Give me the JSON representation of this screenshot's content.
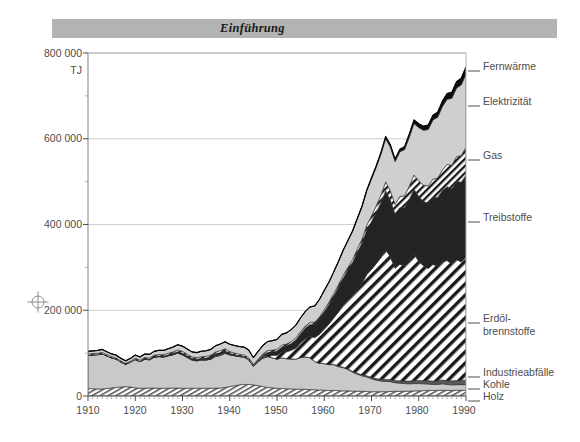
{
  "banner": {
    "title": "Einführung"
  },
  "chart_data": {
    "type": "area",
    "stacked": true,
    "title": "",
    "subtitle": "",
    "xlabel": "",
    "ylabel": "TJ",
    "unit": "TJ",
    "xlim": [
      1910,
      1990
    ],
    "ylim": [
      0,
      800000
    ],
    "xticks": [
      1910,
      1920,
      1930,
      1940,
      1950,
      1960,
      1970,
      1980,
      1990
    ],
    "xticklabels": [
      "1910",
      "1920",
      "1930",
      "1940",
      "1950",
      "1960",
      "1970",
      "1980",
      "1990"
    ],
    "minor_xtick_step": 1,
    "yticks": [
      0,
      200000,
      400000,
      600000,
      800000
    ],
    "yticklabels": [
      "0",
      "200 000",
      "400 000",
      "600 000",
      "800 000"
    ],
    "minor_yticks": [
      100000,
      300000,
      500000,
      700000
    ],
    "grid": "horizontal-major",
    "legend_position": "right-inline",
    "legend": [
      {
        "name": "Fernwärme",
        "fill": "#111111",
        "pattern": "solid-black",
        "y_label": 66
      },
      {
        "name": "Elektrizität",
        "fill": "#cccccc",
        "pattern": "solid-grey",
        "y_label": 101
      },
      {
        "name": "Gas",
        "fill": "#ffffff",
        "pattern": "hatch-fine",
        "y_label": 155
      },
      {
        "name": "Treibstoffe",
        "fill": "#262626",
        "pattern": "solid-dark",
        "y_label": 217
      },
      {
        "name": "Erdöl-\nbrennstoffe",
        "fill": "#ffffff",
        "pattern": "hatch-wide",
        "y_label": 318
      },
      {
        "name": "Industrieabfälle",
        "fill": "#555555",
        "pattern": "solid-grey-dk",
        "y_label": 372
      },
      {
        "name": "Kohle",
        "fill": "#cccccc",
        "pattern": "solid-grey",
        "y_label": 384
      },
      {
        "name": "Holz",
        "fill": "#ffffff",
        "pattern": "hatch-fine",
        "y_label": 396
      }
    ],
    "legend_labels_flat": [
      "Fernwärme",
      "Elektrizität",
      "Gas",
      "Treibstoffe",
      "Erdöl-",
      "brennstoffe",
      "Industrieabfälle",
      "Kohle",
      "Holz"
    ],
    "x": [
      1910,
      1911,
      1912,
      1913,
      1914,
      1915,
      1916,
      1917,
      1918,
      1919,
      1920,
      1921,
      1922,
      1923,
      1924,
      1925,
      1926,
      1927,
      1928,
      1929,
      1930,
      1931,
      1932,
      1933,
      1934,
      1935,
      1936,
      1937,
      1938,
      1939,
      1940,
      1941,
      1942,
      1943,
      1944,
      1945,
      1946,
      1947,
      1948,
      1949,
      1950,
      1951,
      1952,
      1953,
      1954,
      1955,
      1956,
      1957,
      1958,
      1959,
      1960,
      1961,
      1962,
      1963,
      1964,
      1965,
      1966,
      1967,
      1968,
      1969,
      1970,
      1971,
      1972,
      1973,
      1974,
      1975,
      1976,
      1977,
      1978,
      1979,
      1980,
      1981,
      1982,
      1983,
      1984,
      1985,
      1986,
      1987,
      1988,
      1989,
      1990
    ],
    "series": [
      {
        "name": "Holz",
        "values": [
          17000,
          17000,
          16500,
          16500,
          17500,
          19000,
          20000,
          21000,
          22000,
          21000,
          19000,
          18000,
          18000,
          18500,
          18500,
          18000,
          18000,
          18000,
          18500,
          18500,
          18000,
          18000,
          18000,
          18000,
          18000,
          18000,
          18000,
          18500,
          18500,
          20000,
          22000,
          24000,
          26000,
          27000,
          27000,
          26000,
          24000,
          22000,
          20000,
          19000,
          18000,
          17500,
          17000,
          16500,
          16000,
          16000,
          15500,
          15000,
          14500,
          14000,
          13500,
          13000,
          13000,
          12500,
          12000,
          12000,
          11500,
          11000,
          11000,
          10500,
          10000,
          10000,
          10000,
          10000,
          10500,
          11000,
          11000,
          11000,
          11500,
          12000,
          12000,
          12500,
          13000,
          13000,
          13000,
          13500,
          13000,
          13000,
          13500,
          13500,
          13500
        ]
      },
      {
        "name": "Kohle",
        "values": [
          78000,
          79000,
          80000,
          82000,
          76000,
          70000,
          66000,
          58000,
          52000,
          58000,
          66000,
          62000,
          68000,
          66000,
          72000,
          74000,
          73000,
          76000,
          78000,
          82000,
          78000,
          72000,
          66000,
          64000,
          66000,
          66000,
          68000,
          74000,
          76000,
          80000,
          74000,
          70000,
          66000,
          64000,
          58000,
          44000,
          56000,
          66000,
          72000,
          70000,
          68000,
          72000,
          70000,
          70000,
          70000,
          74000,
          76000,
          74000,
          66000,
          62000,
          62000,
          60000,
          60000,
          56000,
          54000,
          50000,
          44000,
          40000,
          36000,
          34000,
          30000,
          27000,
          25000,
          24000,
          23000,
          20000,
          19000,
          18000,
          17000,
          17000,
          17000,
          16000,
          15000,
          14000,
          14000,
          15000,
          14000,
          13000,
          13000,
          13000,
          13000
        ]
      },
      {
        "name": "Industrieabfälle",
        "values": [
          0,
          0,
          0,
          0,
          0,
          0,
          0,
          0,
          0,
          0,
          0,
          0,
          0,
          0,
          0,
          0,
          0,
          0,
          0,
          0,
          0,
          0,
          0,
          0,
          0,
          0,
          0,
          0,
          0,
          0,
          0,
          0,
          0,
          0,
          0,
          0,
          0,
          0,
          0,
          0,
          0,
          0,
          0,
          0,
          0,
          0,
          0,
          0,
          0,
          0,
          500,
          700,
          900,
          1100,
          1300,
          1500,
          1800,
          2100,
          2400,
          2800,
          3200,
          3600,
          4000,
          4400,
          4800,
          5000,
          5400,
          5800,
          6200,
          6600,
          7000,
          7300,
          7600,
          7900,
          8200,
          8600,
          9000,
          9400,
          9800,
          10200,
          10500
        ]
      },
      {
        "name": "Erdölbrennstoffe",
        "values": [
          0,
          0,
          0,
          0,
          0,
          0,
          0,
          0,
          0,
          0,
          0,
          0,
          0,
          0,
          0,
          0,
          0,
          0,
          0,
          0,
          500,
          600,
          700,
          800,
          900,
          1000,
          1200,
          1400,
          1600,
          1400,
          1000,
          600,
          400,
          300,
          200,
          200,
          800,
          2000,
          4000,
          6000,
          9000,
          13000,
          16000,
          20000,
          26000,
          34000,
          42000,
          50000,
          56000,
          68000,
          80000,
          94000,
          108000,
          126000,
          144000,
          160000,
          176000,
          196000,
          214000,
          236000,
          252000,
          268000,
          284000,
          304000,
          286000,
          262000,
          272000,
          268000,
          282000,
          296000,
          278000,
          268000,
          262000,
          272000,
          268000,
          276000,
          280000,
          272000,
          282000,
          276000,
          288000
        ]
      },
      {
        "name": "Treibstoffe",
        "values": [
          0,
          0,
          0,
          0,
          0,
          0,
          0,
          0,
          0,
          0,
          500,
          700,
          900,
          1100,
          1300,
          1600,
          1900,
          2200,
          2600,
          3000,
          3400,
          3200,
          3000,
          3000,
          3200,
          3600,
          4000,
          4600,
          5200,
          4400,
          2600,
          1600,
          1200,
          1000,
          800,
          800,
          2000,
          4000,
          6000,
          8000,
          10000,
          12000,
          14000,
          16000,
          19000,
          22000,
          25000,
          28000,
          31000,
          36000,
          41000,
          46000,
          52000,
          58000,
          64000,
          70000,
          78000,
          86000,
          94000,
          104000,
          112000,
          120000,
          128000,
          136000,
          132000,
          126000,
          132000,
          136000,
          142000,
          150000,
          152000,
          150000,
          152000,
          156000,
          160000,
          166000,
          172000,
          176000,
          182000,
          186000,
          190000
        ]
      },
      {
        "name": "Gas",
        "values": [
          3000,
          3000,
          3000,
          3200,
          3000,
          2800,
          2600,
          2400,
          2200,
          2400,
          2800,
          2800,
          3000,
          3000,
          3200,
          3400,
          3400,
          3600,
          3800,
          4000,
          4000,
          3800,
          3600,
          3600,
          3800,
          3800,
          4000,
          4200,
          4400,
          4400,
          4200,
          4000,
          3800,
          3600,
          3400,
          2600,
          3200,
          3800,
          4000,
          4000,
          4000,
          4200,
          4200,
          4400,
          4400,
          4600,
          4800,
          4800,
          4600,
          4600,
          4800,
          5000,
          5200,
          5600,
          6000,
          6400,
          7000,
          8000,
          9000,
          11000,
          13000,
          15000,
          18000,
          21000,
          22000,
          23000,
          26000,
          28000,
          31000,
          34000,
          36000,
          38000,
          40000,
          43000,
          45000,
          48000,
          52000,
          55000,
          58000,
          62000,
          66000
        ]
      },
      {
        "name": "Elektrizität",
        "values": [
          6000,
          6200,
          6600,
          7000,
          6600,
          6400,
          6600,
          6200,
          6000,
          6400,
          7200,
          7400,
          8000,
          8400,
          9000,
          9600,
          10000,
          10600,
          11200,
          12000,
          12400,
          12000,
          11600,
          11800,
          12400,
          13000,
          13600,
          14600,
          15400,
          16200,
          17000,
          17600,
          18000,
          18200,
          18000,
          16000,
          18000,
          20000,
          21000,
          22000,
          23000,
          25000,
          26000,
          28000,
          30000,
          32000,
          34000,
          36000,
          38000,
          41000,
          44000,
          47000,
          50000,
          54000,
          58000,
          62000,
          66000,
          70000,
          75000,
          80000,
          86000,
          90000,
          95000,
          101000,
          102000,
          100000,
          104000,
          108000,
          114000,
          120000,
          124000,
          128000,
          132000,
          138000,
          142000,
          148000,
          152000,
          156000,
          160000,
          165000,
          170000
        ]
      },
      {
        "name": "Fernwärme",
        "values": [
          0,
          0,
          0,
          0,
          0,
          0,
          0,
          0,
          0,
          0,
          0,
          0,
          0,
          0,
          0,
          0,
          0,
          0,
          0,
          0,
          0,
          0,
          0,
          0,
          0,
          0,
          0,
          0,
          0,
          0,
          0,
          0,
          0,
          0,
          0,
          0,
          0,
          0,
          0,
          0,
          0,
          0,
          0,
          0,
          0,
          0,
          0,
          0,
          0,
          0,
          200,
          300,
          400,
          500,
          700,
          900,
          1200,
          1500,
          1900,
          2400,
          3000,
          3600,
          4300,
          5000,
          5400,
          5600,
          6200,
          6800,
          7600,
          8400,
          9000,
          9600,
          10200,
          11000,
          11800,
          12600,
          13400,
          14200,
          15000,
          15800,
          16500
        ]
      }
    ],
    "totals_note": "Totalverbrauch 1910 ≈ 104 000 TJ, 1990 ≈ 784 000 TJ"
  }
}
